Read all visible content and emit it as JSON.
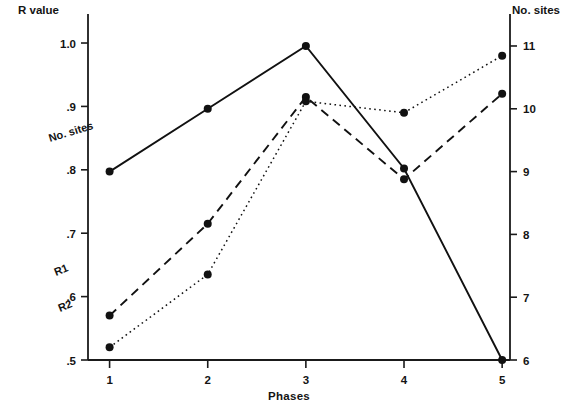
{
  "chart_data": {
    "type": "line",
    "title": "",
    "xlabel": "Phases",
    "ylabel": "R value",
    "y2label": "No. sites",
    "categories": [
      "1",
      "2",
      "3",
      "4",
      "5"
    ],
    "x": [
      1,
      2,
      3,
      4,
      5
    ],
    "xlim": [
      0.78,
      5.08
    ],
    "ylim": [
      0.5,
      1.03
    ],
    "y2lim": [
      6,
      11.35
    ],
    "grid": false,
    "legend_position": "inline-annotations",
    "yticks": [
      ".5",
      ".6",
      ".7",
      ".8",
      ".9",
      "1.0"
    ],
    "ytick_values": [
      0.5,
      0.6,
      0.7,
      0.8,
      0.9,
      1.0
    ],
    "y2ticks": [
      "6",
      "7",
      "8",
      "9",
      "10",
      "11"
    ],
    "y2tick_values": [
      6,
      7,
      8,
      9,
      10,
      11
    ],
    "xticks": [
      "1",
      "2",
      "3",
      "4",
      "5"
    ],
    "series": [
      {
        "name": "No. sites",
        "axis": "right",
        "style": "solid",
        "marker": "filled-circle",
        "values": [
          9.0,
          10.0,
          11.0,
          9.05,
          6.0
        ],
        "values_left_scale": [
          0.8,
          0.9,
          1.0,
          0.805,
          0.5
        ],
        "label": "No. sites",
        "label_rotation": -17
      },
      {
        "name": "R1",
        "axis": "left",
        "style": "dashed",
        "marker": "filled-circle",
        "values": [
          0.57,
          0.715,
          0.915,
          0.785,
          0.92
        ],
        "label": "R1",
        "label_rotation": -22
      },
      {
        "name": "R2",
        "axis": "left",
        "style": "dotted",
        "marker": "filled-circle",
        "values": [
          0.52,
          0.635,
          0.908,
          0.89,
          0.98
        ],
        "label": "R2",
        "label_rotation": -22
      }
    ],
    "colors": {
      "axis": "#1a1a1a",
      "series_no_sites": "#111111",
      "series_r1": "#111111",
      "series_r2": "#111111",
      "background": "#ffffff"
    }
  }
}
